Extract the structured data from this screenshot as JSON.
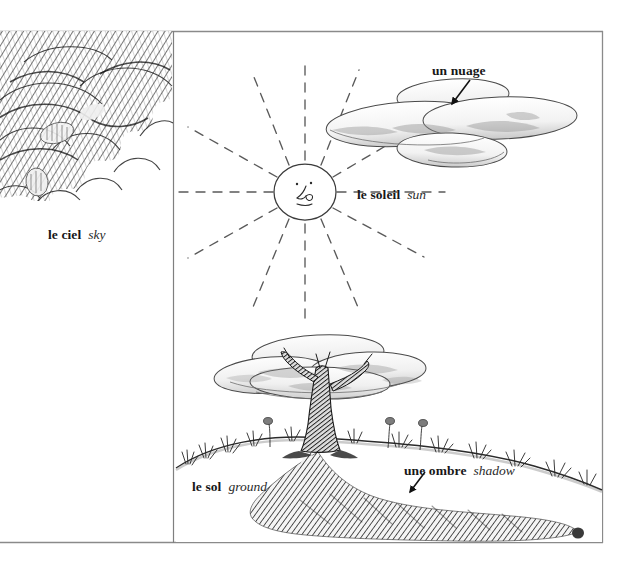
{
  "page": {
    "kind": "illustrated-vocabulary-plate",
    "language_pair": "French to English",
    "background_color": "#ffffff",
    "ink_color": "#171717",
    "frame": {
      "stroke_color": "#8a8a8a",
      "top_y": 31,
      "right_x": 603,
      "bottom_y": 543,
      "divider_x": 173
    }
  },
  "labels": [
    {
      "id": "ciel",
      "fr": "le ciel",
      "en": "sky",
      "x": 48,
      "y": 226,
      "has_leader": false
    },
    {
      "id": "soleil",
      "fr": "le soleil",
      "en": "sun",
      "x": 357,
      "y": 186,
      "has_leader": false
    },
    {
      "id": "nuage",
      "fr": "un nuage",
      "en": "",
      "x": 432,
      "y": 62,
      "has_leader": true
    },
    {
      "id": "sol",
      "fr": "le sol",
      "en": "ground",
      "x": 192,
      "y": 478,
      "has_leader": false
    },
    {
      "id": "ombre",
      "fr": "une ombre",
      "en": "shadow",
      "x": 404,
      "y": 462,
      "has_leader": true
    }
  ],
  "scene": {
    "sky_panel": {
      "name": "overcast-cloud-mass",
      "description": "dense cross-hatched billowing cloud bank filling upper-left panel",
      "bounds": {
        "x": 0,
        "y": 31,
        "width": 173,
        "height": 165
      },
      "tone": "#8e8e8e"
    },
    "sun": {
      "name": "smiling-sun",
      "center_x": 305,
      "center_y": 192,
      "radius_x": 31,
      "radius_y": 28,
      "ray_count": 12,
      "ray_style": "dashed",
      "ray_length": 120,
      "has_face": true
    },
    "cloud_upper": {
      "name": "flat-stacked-cloud",
      "center_x": 445,
      "center_y": 118,
      "width": 235,
      "height": 68,
      "lobes": 4
    },
    "tree": {
      "name": "lone-tree",
      "trunk_x": 322,
      "base_y": 450,
      "canopy_center_x": 320,
      "canopy_center_y": 366,
      "canopy_width": 190,
      "canopy_height": 62
    },
    "ground": {
      "name": "grassy-hill-ridge",
      "crest_y": 437,
      "left_x": 176,
      "right_x": 602,
      "grass_tufts": 11
    },
    "shadow": {
      "name": "cast-shadow",
      "description": "dark hatched shadow sweeping down-right from the tree base",
      "origin_x": 322,
      "origin_y": 452,
      "extends_to_x": 575,
      "extends_to_y": 542,
      "tone": "#4a4a4a"
    }
  }
}
